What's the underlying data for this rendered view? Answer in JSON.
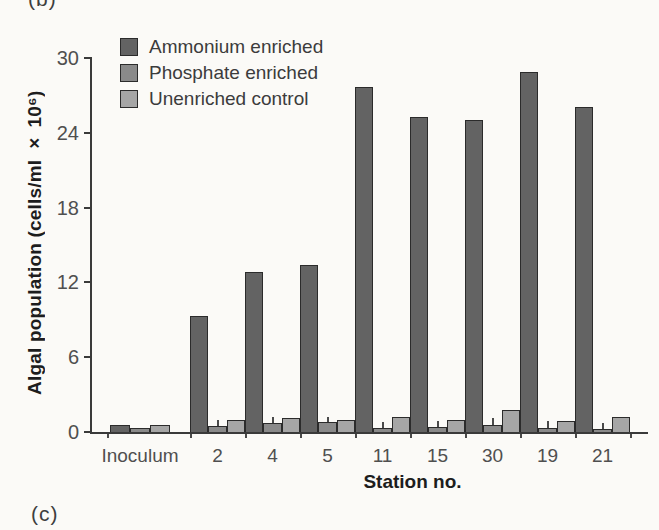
{
  "figure": {
    "panel_label_top": "(b)",
    "panel_label_bottom": "(c)"
  },
  "style": {
    "background": "#fbfaf7",
    "axis_color": "#3a3a3a",
    "tick_text_color": "#4f4f4f",
    "bar_outline": "#2b2b2b"
  },
  "chart_data": {
    "type": "bar",
    "title": "",
    "xlabel": "Station no.",
    "ylabel": "Algal population (cells/ml × 10⁶)",
    "ylim": [
      0,
      30
    ],
    "yticks": [
      0,
      6,
      12,
      18,
      24,
      30
    ],
    "grid": false,
    "legend_position": "top-left inside plot",
    "categories": [
      "Inoculum",
      "2",
      "4",
      "5",
      "11",
      "15",
      "30",
      "19",
      "21"
    ],
    "series": [
      {
        "name": "Ammonium enriched",
        "color": "#636363",
        "values": [
          0.6,
          9.3,
          12.8,
          13.4,
          27.7,
          25.3,
          25.0,
          28.9,
          26.1
        ]
      },
      {
        "name": "Phosphate enriched",
        "color": "#8a8a8a",
        "values": [
          0.35,
          0.5,
          0.7,
          0.8,
          0.3,
          0.4,
          0.6,
          0.35,
          0.25
        ],
        "error_top": [
          null,
          1.0,
          1.2,
          1.2,
          0.8,
          0.9,
          1.1,
          0.9,
          0.7
        ]
      },
      {
        "name": "Unenriched control",
        "color": "#a6a6a6",
        "values": [
          0.6,
          1.0,
          1.1,
          1.0,
          1.2,
          1.0,
          1.8,
          0.9,
          1.2
        ]
      }
    ]
  }
}
